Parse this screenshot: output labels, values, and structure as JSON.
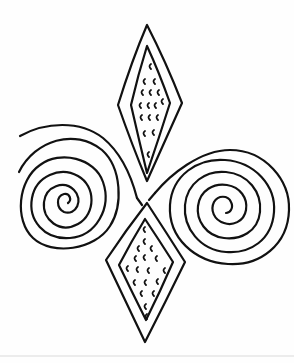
{
  "artwork": {
    "title": "Spiral and diamond line-art design",
    "style": "black outline coloring page",
    "colors": {
      "background": "#fefefe",
      "line": "#111111",
      "rule": "#ececec"
    },
    "elements": [
      {
        "name": "top-diamond",
        "type": "nested-lozenge",
        "pattern": "c-shaped marks"
      },
      {
        "name": "bottom-diamond",
        "type": "nested-lozenge",
        "pattern": "c-shaped marks"
      },
      {
        "name": "left-spiral",
        "type": "spiral"
      },
      {
        "name": "right-spiral",
        "type": "spiral"
      }
    ]
  }
}
